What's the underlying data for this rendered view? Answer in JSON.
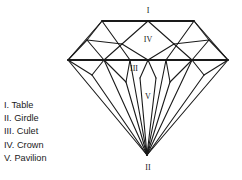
{
  "diagram": {
    "stroke_color": "#1a1a1a",
    "background_color": "#ffffff",
    "labels": [
      {
        "id": "table",
        "text": "I",
        "x": 148,
        "y": 11
      },
      {
        "id": "crown",
        "text": "IV",
        "x": 148,
        "y": 40
      },
      {
        "id": "culet",
        "text": "III",
        "x": 134,
        "y": 69
      },
      {
        "id": "pavilion",
        "text": "V",
        "x": 148,
        "y": 97
      },
      {
        "id": "girdle",
        "text": "II",
        "x": 148,
        "y": 168
      }
    ],
    "vertices": {
      "table_left": [
        102,
        21
      ],
      "table_right": [
        194,
        21
      ],
      "table_mid": [
        148,
        21
      ],
      "girdle_left": [
        68,
        60
      ],
      "girdle_right": [
        228,
        60
      ],
      "girdle_mid": [
        148,
        60
      ],
      "culet": [
        147,
        155
      ]
    }
  },
  "legend": {
    "items": [
      {
        "numeral": "I.",
        "term": "Table",
        "full": "I. Table"
      },
      {
        "numeral": "II.",
        "term": "Girdle",
        "full": "II. Girdle"
      },
      {
        "numeral": "III.",
        "term": "Culet",
        "full": "III. Culet"
      },
      {
        "numeral": "IV.",
        "term": "Crown",
        "full": "IV. Crown"
      },
      {
        "numeral": "V.",
        "term": "Pavilion",
        "full": "V. Pavilion"
      }
    ]
  }
}
